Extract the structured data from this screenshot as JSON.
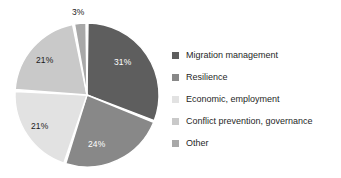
{
  "chart_data": {
    "type": "pie",
    "title": "",
    "subtitle": "",
    "xlabel": "",
    "ylabel": "",
    "legend_position": "right",
    "grid": false,
    "unit": "%",
    "start_angle_deg": 0,
    "direction": "clockwise",
    "categories": [
      "Migration management",
      "Resilience",
      "Economic, employment",
      "Conflict prevention, governance",
      "Other"
    ],
    "values": [
      31,
      24,
      21,
      21,
      3
    ],
    "value_labels": [
      "31%",
      "24%",
      "21%",
      "21%",
      "3%"
    ],
    "colors": [
      "#5e5e5e",
      "#888888",
      "#e2e2e2",
      "#c9c9c9",
      "#a8a8a8"
    ],
    "slices": [
      {
        "name": "Migration management",
        "value": 31,
        "label": "31%",
        "color": "#5e5e5e",
        "label_color": "#ffffff",
        "start_deg": 0,
        "end_deg": 111.6,
        "label_x": 114,
        "label_y": 57
      },
      {
        "name": "Resilience",
        "value": 24,
        "label": "24%",
        "color": "#888888",
        "label_color": "#ffffff",
        "start_deg": 111.6,
        "end_deg": 198.0,
        "label_x": 88,
        "label_y": 139
      },
      {
        "name": "Economic, employment",
        "value": 21,
        "label": "21%",
        "color": "#e2e2e2",
        "label_color": "#1a1a1a",
        "start_deg": 198.0,
        "end_deg": 273.6,
        "label_x": 31,
        "label_y": 121
      },
      {
        "name": "Conflict prevention, governance",
        "value": 21,
        "label": "21%",
        "color": "#c9c9c9",
        "label_color": "#1a1a1a",
        "start_deg": 273.6,
        "end_deg": 349.2,
        "label_x": 36,
        "label_y": 55
      },
      {
        "name": "Other",
        "value": 3,
        "label": "3%",
        "color": "#a8a8a8",
        "label_color": "#1a1a1a",
        "start_deg": 349.2,
        "end_deg": 360.0,
        "label_x": 72,
        "label_y": 7
      }
    ]
  },
  "legend": {
    "items": [
      {
        "label": "Migration management",
        "color": "#5e5e5e"
      },
      {
        "label": "Resilience",
        "color": "#888888"
      },
      {
        "label": "Economic, employment",
        "color": "#e2e2e2"
      },
      {
        "label": "Conflict prevention, governance",
        "color": "#c9c9c9"
      },
      {
        "label": "Other",
        "color": "#a8a8a8"
      }
    ]
  },
  "geometry": {
    "center_x": 87,
    "center_y": 95,
    "radius": 72,
    "gap_deg": 1.6
  }
}
